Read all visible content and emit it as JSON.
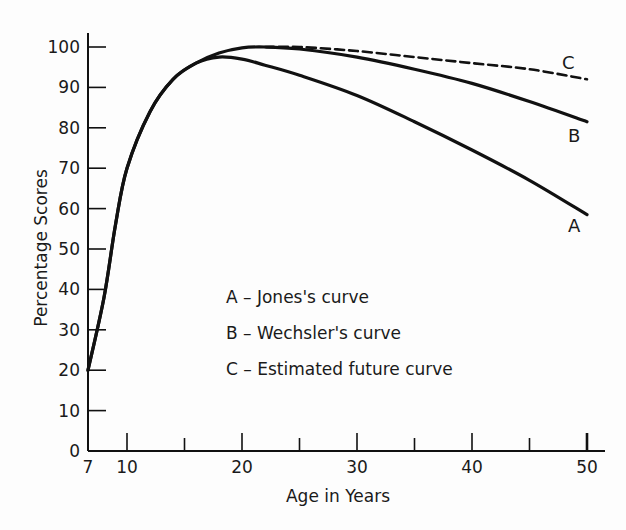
{
  "chart_data": {
    "type": "line",
    "title": "",
    "xlabel": "Age in Years",
    "ylabel": "Percentage Scores",
    "xlim": [
      7,
      51
    ],
    "ylim": [
      0,
      102
    ],
    "x_tick_labels": [
      "7",
      "10",
      "20",
      "30",
      "40",
      "50"
    ],
    "x_ticks": [
      7,
      10,
      20,
      30,
      40,
      50
    ],
    "x_minor_ticks": [
      15,
      25,
      35,
      45
    ],
    "y_ticks": [
      0,
      10,
      20,
      30,
      40,
      50,
      60,
      70,
      80,
      90,
      100
    ],
    "y_tick_labels": [
      "0",
      "10",
      "20",
      "30",
      "40",
      "50",
      "60",
      "70",
      "80",
      "90",
      "100"
    ],
    "grid": false,
    "legend_position": "inside, lower center",
    "legend": [
      "A – Jones's curve",
      "B – Wechsler's curve",
      "C – Estimated future curve"
    ],
    "x": [
      7,
      8,
      9,
      10,
      12,
      14,
      16,
      18,
      20,
      22,
      25,
      30,
      35,
      40,
      45,
      50
    ],
    "series": [
      {
        "name": "A",
        "label": "Jones's curve",
        "style": "solid",
        "values": [
          20,
          38,
          56,
          70,
          84,
          92,
          96,
          97.5,
          97,
          95.5,
          93,
          88,
          81.5,
          74.5,
          67,
          58.5
        ]
      },
      {
        "name": "B",
        "label": "Wechsler's curve",
        "style": "solid",
        "values": [
          20,
          38,
          56,
          70,
          84,
          92,
          96,
          98.5,
          99.8,
          100,
          99.5,
          97.5,
          94.5,
          91,
          86.5,
          81.5
        ]
      },
      {
        "name": "C",
        "label": "Estimated future curve",
        "style": "dashed",
        "values": [
          20,
          38,
          56,
          70,
          84,
          92,
          96,
          98.5,
          99.8,
          100,
          100,
          99,
          97.5,
          96,
          94.5,
          92
        ]
      }
    ],
    "curve_end_labels": [
      "A",
      "B",
      "C"
    ]
  },
  "labels": {
    "xlabel": "Age in Years",
    "ylabel": "Percentage Scores",
    "legend_a": "A – Jones's curve",
    "legend_b": "B – Wechsler's curve",
    "legend_c": "C – Estimated future curve",
    "end_a": "A",
    "end_b": "B",
    "end_c": "C"
  },
  "colors": {
    "ink": "#111111",
    "background": "#fdfdfd"
  }
}
